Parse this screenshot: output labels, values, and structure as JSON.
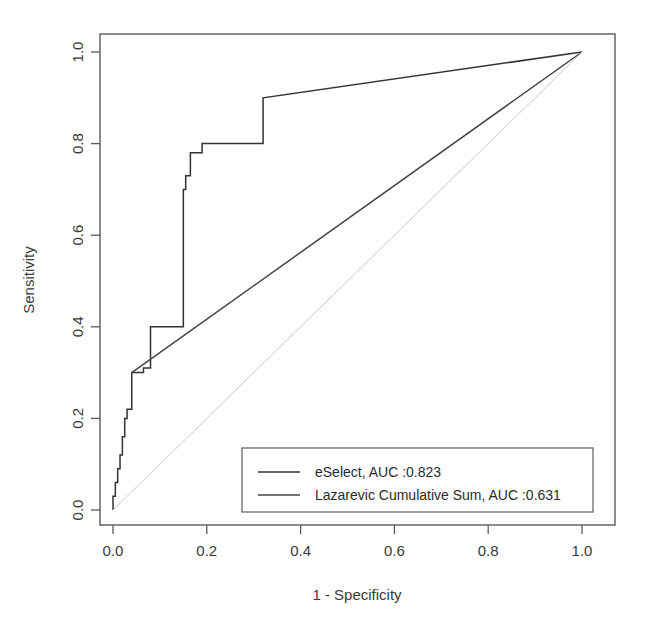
{
  "chart_data": {
    "type": "line",
    "title": "",
    "xlabel": "1 - Specificity",
    "ylabel": "Sensitivity",
    "xlim": [
      0.0,
      1.0
    ],
    "ylim": [
      0.0,
      1.0
    ],
    "grid": false,
    "legend_position": "bottom-right",
    "xticks": [
      "0.0",
      "0.2",
      "0.4",
      "0.6",
      "0.8",
      "1.0"
    ],
    "xtick_values": [
      0.0,
      0.2,
      0.4,
      0.6,
      0.8,
      1.0
    ],
    "yticks": [
      "0.0",
      "0.2",
      "0.4",
      "0.6",
      "0.8",
      "1.0"
    ],
    "ytick_values": [
      0.0,
      0.2,
      0.4,
      0.6,
      0.8,
      1.0
    ],
    "series": [
      {
        "name": "eSelect, AUC :0.823",
        "short_name": "eSelect",
        "auc": 0.823,
        "color": "#333333",
        "style": "step",
        "x": [
          0.0,
          0.0,
          0.005,
          0.005,
          0.01,
          0.01,
          0.015,
          0.015,
          0.02,
          0.02,
          0.025,
          0.025,
          0.03,
          0.03,
          0.04,
          0.04,
          0.065,
          0.065,
          0.08,
          0.08,
          0.15,
          0.15,
          0.155,
          0.155,
          0.165,
          0.165,
          0.19,
          0.19,
          0.32,
          0.32,
          1.0
        ],
        "y": [
          0.0,
          0.03,
          0.03,
          0.06,
          0.06,
          0.09,
          0.09,
          0.12,
          0.12,
          0.16,
          0.16,
          0.2,
          0.2,
          0.22,
          0.22,
          0.3,
          0.3,
          0.31,
          0.31,
          0.4,
          0.4,
          0.7,
          0.7,
          0.73,
          0.73,
          0.78,
          0.78,
          0.8,
          0.8,
          0.9,
          1.0
        ]
      },
      {
        "name": "Lazarevic Cumulative Sum, AUC :0.631",
        "short_name": "Lazarevic Cumulative Sum",
        "auc": 0.631,
        "color": "#444444",
        "style": "line",
        "x": [
          0.04,
          1.0
        ],
        "y": [
          0.3,
          1.0
        ]
      },
      {
        "name": "chance-diagonal",
        "short_name": "chance",
        "color": "#c9c9c9",
        "style": "reference",
        "x": [
          0.0,
          1.0
        ],
        "y": [
          0.0,
          1.0
        ]
      }
    ]
  },
  "axes": {
    "x_title": "1 - Specificity",
    "y_title": "Sensitivity",
    "x_tick_labels": [
      "0.0",
      "0.2",
      "0.4",
      "0.6",
      "0.8",
      "1.0"
    ],
    "y_tick_labels": [
      "0.0",
      "0.2",
      "0.4",
      "0.6",
      "0.8",
      "1.0"
    ]
  },
  "legend": {
    "entries": [
      {
        "label": "eSelect, AUC :0.823",
        "color": "#333333"
      },
      {
        "label": "Lazarevic Cumulative Sum, AUC :0.631",
        "color": "#444444"
      }
    ]
  },
  "colors": {
    "background": "#ffffff",
    "frame": "#5a5a5a",
    "eselect": "#333333",
    "lazarevic": "#444444",
    "chance": "#c9c9c9",
    "text": "#2b2b2b"
  }
}
